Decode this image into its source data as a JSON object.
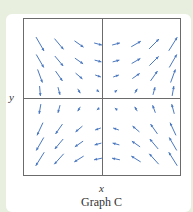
{
  "figure": {
    "caption": "Graph C",
    "x_axis_label": "x",
    "y_axis_label": "y",
    "arrow_color": "#4a78c0",
    "axis_color": "#6b6b6b",
    "background_color": "#e9efdf",
    "type": "slope field (direction field)",
    "columns": 8,
    "rows": 8,
    "arrows": [
      [
        [
          300,
          16
        ],
        [
          310,
          14
        ],
        [
          325,
          11
        ],
        [
          345,
          8
        ],
        [
          15,
          8
        ],
        [
          30,
          11
        ],
        [
          45,
          14
        ],
        [
          58,
          16
        ]
      ],
      [
        [
          300,
          15
        ],
        [
          310,
          13
        ],
        [
          325,
          10
        ],
        [
          345,
          7
        ],
        [
          15,
          7
        ],
        [
          30,
          10
        ],
        [
          45,
          13
        ],
        [
          60,
          15
        ]
      ],
      [
        [
          290,
          14
        ],
        [
          305,
          12
        ],
        [
          320,
          9
        ],
        [
          340,
          6
        ],
        [
          20,
          6
        ],
        [
          35,
          9
        ],
        [
          55,
          12
        ],
        [
          70,
          14
        ]
      ],
      [
        [
          275,
          10
        ],
        [
          285,
          8
        ],
        [
          300,
          5
        ],
        [
          320,
          3
        ],
        [
          40,
          3
        ],
        [
          60,
          5
        ],
        [
          75,
          8
        ],
        [
          80,
          10
        ]
      ],
      [
        [
          260,
          10
        ],
        [
          255,
          8
        ],
        [
          240,
          5
        ],
        [
          220,
          3
        ],
        [
          140,
          3
        ],
        [
          120,
          5
        ],
        [
          110,
          8
        ],
        [
          105,
          10
        ]
      ],
      [
        [
          245,
          14
        ],
        [
          235,
          12
        ],
        [
          220,
          9
        ],
        [
          200,
          6
        ],
        [
          160,
          6
        ],
        [
          140,
          9
        ],
        [
          125,
          12
        ],
        [
          115,
          14
        ]
      ],
      [
        [
          240,
          15
        ],
        [
          230,
          13
        ],
        [
          215,
          10
        ],
        [
          195,
          7
        ],
        [
          165,
          7
        ],
        [
          145,
          10
        ],
        [
          130,
          13
        ],
        [
          120,
          15
        ]
      ],
      [
        [
          238,
          16
        ],
        [
          228,
          14
        ],
        [
          212,
          11
        ],
        [
          192,
          8
        ],
        [
          168,
          8
        ],
        [
          148,
          11
        ],
        [
          132,
          14
        ],
        [
          122,
          16
        ]
      ]
    ]
  }
}
